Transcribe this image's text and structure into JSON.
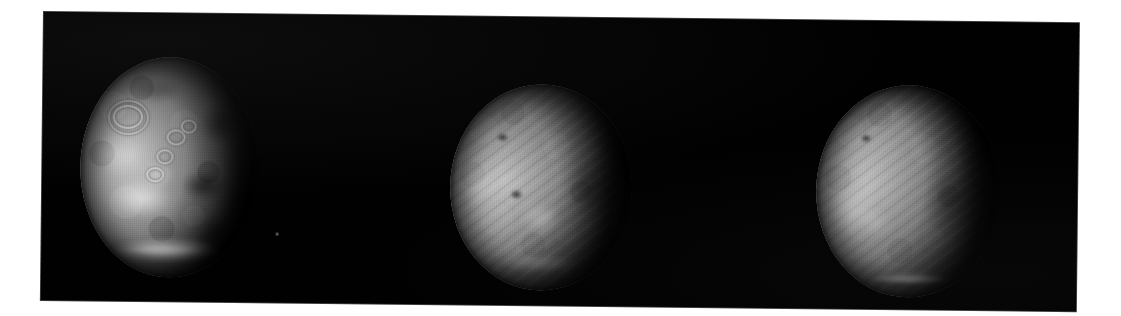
{
  "figure": {
    "kind": "scanned-figure-plate",
    "background_color": "#ffffff",
    "plate_color": "#000000",
    "panel_count": 3
  },
  "panels": [
    {
      "id": "panel-1",
      "name": "mars-disk-clear",
      "appearance": "high-contrast surface view",
      "phase": "gibbous, terminator on right limb",
      "features": [
        "bright western albedo region",
        "ringed volcano caldera upper left",
        "chain of three smaller volcano rings",
        "dark mottled terrain on right limb",
        "bright south polar cap at bottom"
      ],
      "polar_cap": "bright",
      "striping": "none"
    },
    {
      "id": "panel-2",
      "name": "mars-disk-hazy",
      "appearance": "low-contrast dust-obscured view",
      "phase": "gibbous, terminator on right limb",
      "features": [
        "two dark volcano summit spots",
        "bright patch lower centre",
        "diagonal raster striping artifact"
      ],
      "polar_cap": "faint",
      "striping": "diagonal"
    },
    {
      "id": "panel-3",
      "name": "mars-disk-hazy-limb",
      "appearance": "low-contrast dust-obscured view",
      "phase": "gibbous, terminator on right limb",
      "features": [
        "dark spot upper left quadrant",
        "broad bright western limb",
        "diagonal raster striping artifact",
        "bright white arc along south limb"
      ],
      "polar_cap": "bright limb arc",
      "striping": "diagonal"
    }
  ],
  "colors": {
    "sky": "#000000",
    "page": "#ffffff",
    "disk_highlight": "#e8e8e8",
    "disk_midtone": "#8a8a8a",
    "disk_shadow": "#1a1a1a",
    "polar_cap": "#ffffff"
  }
}
